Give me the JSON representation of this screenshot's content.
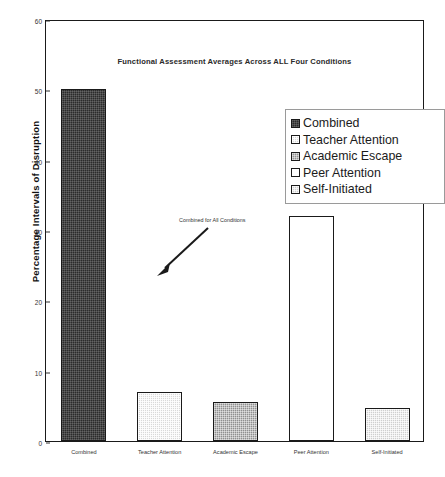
{
  "chart_data": {
    "type": "bar",
    "title": "Functional Assessment Averages Across ALL Four Conditions",
    "xlabel": "",
    "ylabel": "Percentage Intervals of Disruption",
    "ylim": [
      0,
      60
    ],
    "ytick_step": 10,
    "yticks": [
      "0",
      "10",
      "20",
      "30",
      "40",
      "50",
      "60"
    ],
    "grid": false,
    "legend_position": "upper-right-inside",
    "categories": [
      "Combined",
      "Teacher Attention",
      "Academic Escape",
      "Peer Attention",
      "Self-Initiated"
    ],
    "values": [
      50,
      7,
      5.5,
      32,
      4.7
    ],
    "series": [
      {
        "name": "Functional Assessment Average",
        "values": [
          50,
          7,
          5.5,
          32,
          4.7
        ]
      }
    ],
    "legend": [
      {
        "label": "Combined",
        "pattern": "dark"
      },
      {
        "label": "Teacher Attention",
        "pattern": "light"
      },
      {
        "label": "Academic Escape",
        "pattern": "medium"
      },
      {
        "label": "Peer Attention",
        "pattern": "white"
      },
      {
        "label": "Self-Initiated",
        "pattern": "lightmed"
      }
    ],
    "annotations": [
      {
        "text": "Combined for All Conditions",
        "points_to": "Combined"
      }
    ],
    "colors": {
      "axis": "#1a1a1a",
      "text": "#1b1b1b",
      "dark": "#2b2b2b",
      "light": "#d9d9d9",
      "medium": "#8f8f8f",
      "white": "#ffffff",
      "lightmed": "#cfcfcf"
    }
  }
}
